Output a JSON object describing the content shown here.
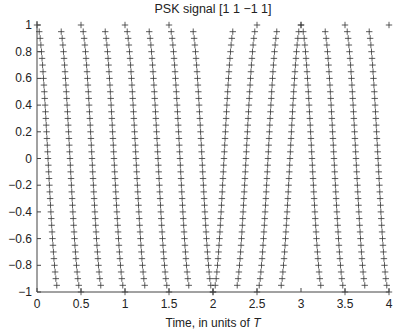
{
  "chart_data": {
    "type": "scatter",
    "title": "PSK signal [1 1 −1 1]",
    "xlabel": "Time, in units of ",
    "xlabel_italic": "T",
    "ylabel": "",
    "xlim": [
      0,
      4
    ],
    "ylim": [
      -1,
      1
    ],
    "grid": false,
    "legend": null,
    "marker": "+",
    "x_ticks": [
      0,
      0.5,
      1,
      1.5,
      2,
      2.5,
      3,
      3.5,
      4
    ],
    "x_tick_labels": [
      "0",
      "0.5",
      "1",
      "1.5",
      "2",
      "2.5",
      "3",
      "3.5",
      "4"
    ],
    "y_ticks": [
      1,
      0.8,
      0.6,
      0.4,
      0.2,
      0,
      -0.2,
      -0.4,
      -0.6,
      -0.8,
      -1
    ],
    "y_tick_labels": [
      "1",
      "0.8",
      "0.6",
      "0.4",
      "0.2",
      "0",
      "−0.2",
      "−0.4",
      "−0.6",
      "−0.8",
      "−1"
    ],
    "bits": [
      1,
      1,
      -1,
      1
    ],
    "carrier_cycles_per_T": 2,
    "signal": "b_k * cos(2*pi*2*t) for t in [k, k+1)",
    "peaks_x": [
      0,
      0.5,
      1,
      1.5,
      2.25,
      2.75,
      3.5,
      4
    ],
    "troughs_x": [
      0.25,
      0.75,
      1.25,
      1.75,
      2,
      2.5,
      3,
      3.25,
      3.75
    ],
    "samples_per_quarter_cycle": 20
  }
}
